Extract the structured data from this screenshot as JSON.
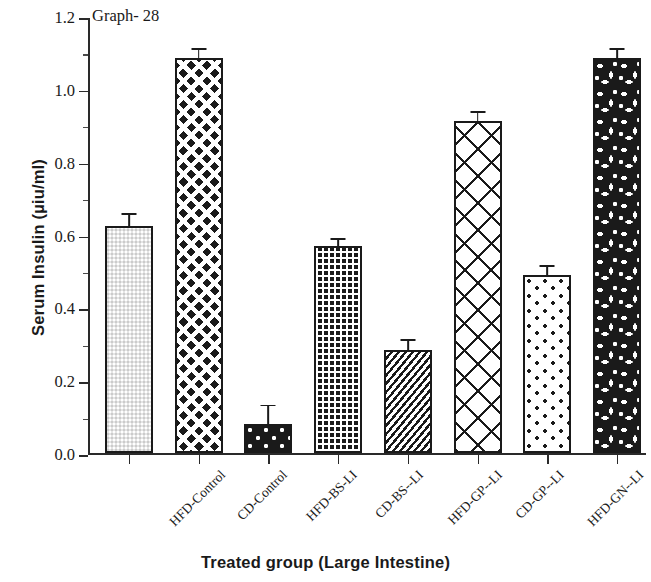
{
  "chart_data": {
    "type": "bar",
    "title": "Graph- 28",
    "xlabel": "Treated group (Large Intestine)",
    "ylabel": "Serum Insulin (µiu/ml)",
    "ylim": [
      0.0,
      1.2
    ],
    "ytick_labels": [
      "1.2",
      "1.0",
      "0.8",
      "0.6",
      "0.4",
      "0.2",
      "0.0"
    ],
    "ytick_values": [
      1.2,
      1.0,
      0.8,
      0.6,
      0.4,
      0.2,
      0.0
    ],
    "yminor_values": [
      1.1,
      0.9,
      0.7,
      0.5,
      0.3,
      0.1
    ],
    "grid": false,
    "legend": "none",
    "categories": [
      "HFD-Control",
      "CD-Control",
      "HFD-BS-LI",
      "CD-BS--LI",
      "HFD-GP--LI",
      "CD-GP--LI",
      "HFD-GN--LI",
      "CD-GN--LI"
    ],
    "values": [
      0.625,
      1.085,
      0.08,
      0.57,
      0.285,
      0.912,
      0.49,
      1.085
    ],
    "errors": [
      0.018,
      0.013,
      0.038,
      0.006,
      0.012,
      0.012,
      0.012,
      0.011
    ],
    "patterns": [
      "fine-checkerboard",
      "large-diamond-lattice",
      "white-dots-on-black",
      "fine-white-grid-on-black",
      "diagonal-hatch-noise",
      "large-x-crosshatch",
      "sparse-black-dots",
      "black-blotch-mosaic"
    ],
    "bar_color": "#1a1a1a",
    "background_color": "#ffffff"
  }
}
